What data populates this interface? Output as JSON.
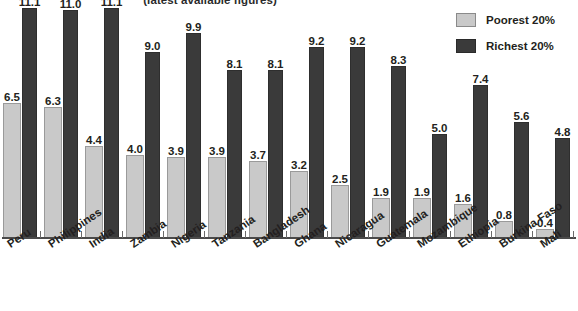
{
  "chart_data": {
    "type": "bar",
    "title": "(latest available figures)",
    "xlabel": "",
    "ylabel": "",
    "ylim": [
      0,
      12
    ],
    "grid": false,
    "legend_position": "top-right",
    "categories": [
      "Peru",
      "Philippines",
      "India",
      "Zambia",
      "Nigeria",
      "Tanzania",
      "Bangladesh",
      "Ghana",
      "Nicaragua",
      "Guatemala",
      "Mozambique",
      "Ethiopia",
      "Burkina Faso",
      "Mali"
    ],
    "series": [
      {
        "name": "Poorest 20%",
        "color": "#c9c9c9",
        "values": [
          6.5,
          6.3,
          4.4,
          4.0,
          3.9,
          3.9,
          3.7,
          3.2,
          2.5,
          1.9,
          1.9,
          1.6,
          0.8,
          0.4
        ],
        "labels": [
          "6.5",
          "6.3",
          "4.4",
          "4.0",
          "3.9",
          "3.9",
          "3.7",
          "3.2",
          "2.5",
          "1.9",
          "1.9",
          "1.6",
          "0.8",
          "0.4"
        ]
      },
      {
        "name": "Richest 20%",
        "color": "#3a3a3a",
        "values": [
          11.1,
          11.0,
          11.1,
          9.0,
          9.9,
          8.1,
          8.1,
          9.2,
          9.2,
          8.3,
          5.0,
          7.4,
          5.6,
          4.8
        ],
        "labels": [
          "11.1",
          "11.0",
          "11.1",
          "9.0",
          "9.9",
          "8.1",
          "8.1",
          "9.2",
          "9.2",
          "8.3",
          "5.0",
          "7.4",
          "5.6",
          "4.8"
        ]
      }
    ]
  },
  "legend": {
    "items": [
      {
        "label": "Poorest 20%",
        "swatch": "poorest"
      },
      {
        "label": "Richest 20%",
        "swatch": "richest"
      }
    ]
  },
  "footer": {
    "note": ""
  }
}
